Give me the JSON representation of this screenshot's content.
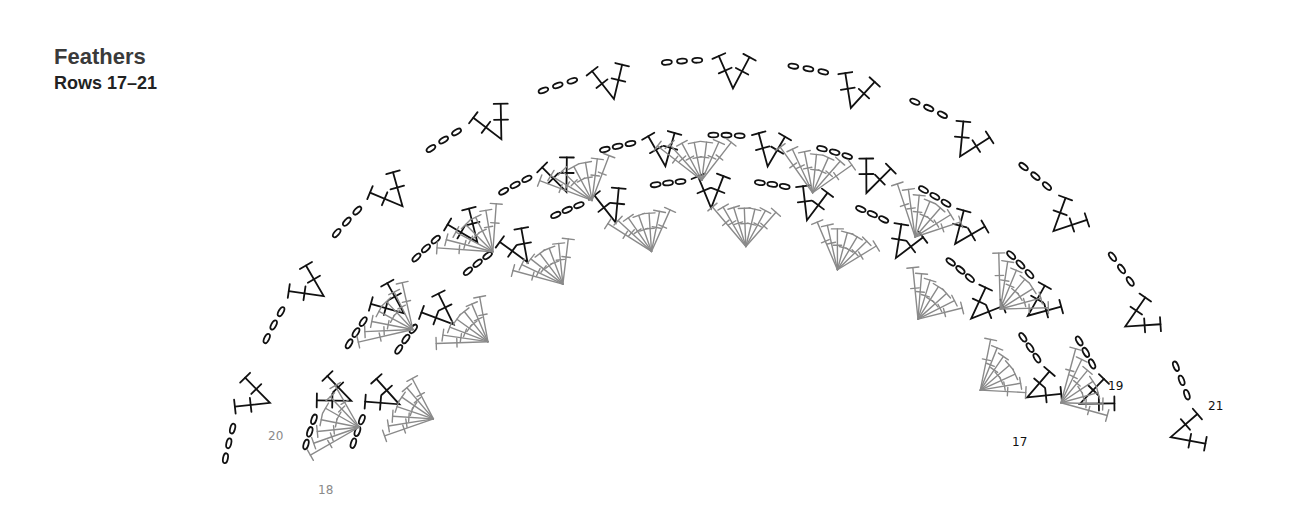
{
  "header": {
    "title": "Feathers",
    "subtitle": "Rows 17–21"
  },
  "colors": {
    "black_rows": "#111111",
    "gray_rows": "#8a8a8a",
    "title": "#3a3a3a"
  },
  "chart": {
    "center": [
      715,
      560
    ],
    "rows": [
      {
        "row": "17",
        "kind": "black",
        "radius": 380,
        "start_deg": 196,
        "end_deg": 338,
        "segments": 9
      },
      {
        "row": "18",
        "kind": "gray",
        "radius": 345,
        "start_deg": 198,
        "end_deg": 336,
        "segments": 8
      },
      {
        "row": "19",
        "kind": "black",
        "radius": 425,
        "start_deg": 194,
        "end_deg": 342,
        "segments": 10
      },
      {
        "row": "20",
        "kind": "gray",
        "radius": 410,
        "start_deg": 192,
        "end_deg": 344,
        "segments": 9
      },
      {
        "row": "21",
        "kind": "black",
        "radius": 500,
        "start_deg": 190,
        "end_deg": 350,
        "segments": 11
      }
    ],
    "labels": [
      {
        "text": "17",
        "x": 1012,
        "y": 446,
        "kind": "black"
      },
      {
        "text": "18",
        "x": 318,
        "y": 494,
        "kind": "gray"
      },
      {
        "text": "19",
        "x": 1108,
        "y": 390,
        "kind": "black"
      },
      {
        "text": "20",
        "x": 268,
        "y": 440,
        "kind": "gray"
      },
      {
        "text": "21",
        "x": 1208,
        "y": 410,
        "kind": "black"
      }
    ]
  }
}
